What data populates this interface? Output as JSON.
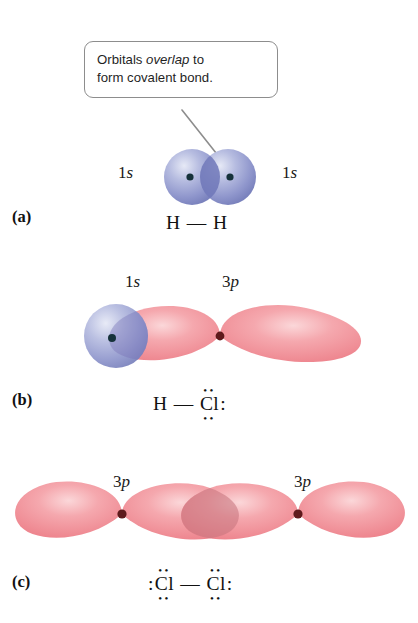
{
  "figure": {
    "callout": {
      "line1_pre": "Orbitals ",
      "line1_em": "overlap",
      "line1_post": " to",
      "line2": "form covalent bond."
    },
    "colors": {
      "s_orbital_blue": "#8f96cc",
      "s_orbital_light": "#ced2ea",
      "s_orbital_overlap": "#6f77b8",
      "p_orbital_pink": "#f29098",
      "p_orbital_light": "#f9c6c9",
      "p_orbital_overlap": "#d98189",
      "nucleus_dark": "#16323a",
      "nucleus_maroon": "#5e1a1c",
      "callout_border": "#8d8d8d",
      "text": "#111111",
      "background": "#ffffff"
    },
    "panels": [
      {
        "id": "a",
        "letter": "(a)",
        "orbital_labels": [
          {
            "text": "1s",
            "numeral": "1",
            "italic": "s",
            "side": "left"
          },
          {
            "text": "1s",
            "numeral": "1",
            "italic": "s",
            "side": "right"
          }
        ],
        "formula": "H — H",
        "atoms": [
          {
            "symbol": "H",
            "dots_top": "",
            "dots_bottom": "",
            "lone_pair_left": "",
            "lone_pair_right": ""
          },
          {
            "symbol": "H",
            "dots_top": "",
            "dots_bottom": "",
            "lone_pair_left": "",
            "lone_pair_right": ""
          }
        ],
        "bond": "—",
        "description": "Two 1s spherical orbitals overlapping to form H2"
      },
      {
        "id": "b",
        "letter": "(b)",
        "orbital_labels": [
          {
            "text": "1s",
            "numeral": "1",
            "italic": "s",
            "side": "left"
          },
          {
            "text": "3p",
            "numeral": "3",
            "italic": "p",
            "side": "right"
          }
        ],
        "formula": "H — Cl:",
        "atoms": [
          {
            "symbol": "H",
            "dots_top": "",
            "dots_bottom": "",
            "lone_pair_left": "",
            "lone_pair_right": ""
          },
          {
            "symbol": "Cl",
            "dots_top": "••",
            "dots_bottom": "••",
            "lone_pair_left": "",
            "lone_pair_right": ":"
          }
        ],
        "bond": "—",
        "description": "A 1s spherical orbital overlapping one lobe of a 3p dumbbell orbital to form HCl"
      },
      {
        "id": "c",
        "letter": "(c)",
        "orbital_labels": [
          {
            "text": "3p",
            "numeral": "3",
            "italic": "p",
            "side": "left"
          },
          {
            "text": "3p",
            "numeral": "3",
            "italic": "p",
            "side": "right"
          }
        ],
        "formula": ":Cl — Cl:",
        "atoms": [
          {
            "symbol": "Cl",
            "dots_top": "••",
            "dots_bottom": "••",
            "lone_pair_left": ":",
            "lone_pair_right": ""
          },
          {
            "symbol": "Cl",
            "dots_top": "••",
            "dots_bottom": "••",
            "lone_pair_left": "",
            "lone_pair_right": ":"
          }
        ],
        "bond": "—",
        "description": "Two 3p dumbbell orbitals overlapping end-to-end to form Cl2"
      }
    ]
  }
}
